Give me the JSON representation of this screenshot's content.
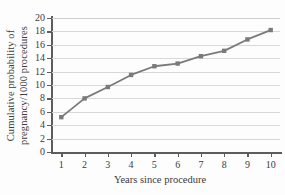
{
  "chart_data": {
    "type": "line",
    "title": "",
    "xlabel": "Years since procedure",
    "ylabel": "Cumulative probability of pregnancy/1000 procedures",
    "ylabel_lines": [
      "Cumulative probability of",
      "pregnancy/1000 procedures"
    ],
    "x": [
      1,
      2,
      3,
      4,
      5,
      6,
      7,
      8,
      9,
      10
    ],
    "values": [
      5.2,
      8.0,
      9.7,
      11.5,
      12.8,
      13.2,
      14.3,
      15.1,
      16.8,
      18.2
    ],
    "xticks": [
      "1",
      "2",
      "3",
      "4",
      "5",
      "6",
      "7",
      "8",
      "9",
      "10"
    ],
    "yticks": [
      "0",
      "2",
      "4",
      "6",
      "8",
      "10",
      "12",
      "14",
      "16",
      "18",
      "20"
    ],
    "xlim": [
      0.6,
      10.4
    ],
    "ylim": [
      0,
      20
    ],
    "grid": "horizontal",
    "legend": "none",
    "series_color": "#7a7a7a",
    "marker": "square",
    "axis_color": "#5d5d5d",
    "grid_color": "#d8d8d8",
    "background": "#fdfdfd"
  }
}
